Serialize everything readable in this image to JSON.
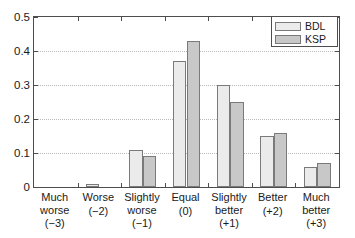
{
  "chart_data": {
    "type": "bar",
    "title": "",
    "xlabel": "",
    "ylabel": "",
    "ylim": [
      0,
      0.5
    ],
    "yticks": [
      "0",
      "0.1",
      "0.2",
      "0.3",
      "0.4",
      "0.5"
    ],
    "ytick_values": [
      0,
      0.1,
      0.2,
      0.3,
      0.4,
      0.5
    ],
    "grid": true,
    "legend_position": "top-right",
    "categories": [
      "Much worse",
      "Worse",
      "Slightly worse",
      "Equal",
      "Slightly better",
      "Better",
      "Much better"
    ],
    "category_lines": [
      {
        "line1": "Much",
        "line2": "worse",
        "value": "(−3)"
      },
      {
        "line1": "Worse",
        "line2": "",
        "value": "(−2)"
      },
      {
        "line1": "Slightly",
        "line2": "worse",
        "value": "(−1)"
      },
      {
        "line1": "Equal",
        "line2": "",
        "value": "(0)"
      },
      {
        "line1": "Slightly",
        "line2": "better",
        "value": "(+1)"
      },
      {
        "line1": "Better",
        "line2": "",
        "value": "(+2)"
      },
      {
        "line1": "Much",
        "line2": "better",
        "value": "(+3)"
      }
    ],
    "series": [
      {
        "name": "BDL",
        "color": "#ebebeb",
        "values": [
          0,
          0.01,
          0.11,
          0.37,
          0.3,
          0.15,
          0.06
        ]
      },
      {
        "name": "KSP",
        "color": "#c8c8c8",
        "values": [
          0,
          0,
          0.09,
          0.43,
          0.25,
          0.16,
          0.07
        ]
      }
    ]
  },
  "legend": {
    "entries": [
      {
        "label": "BDL"
      },
      {
        "label": "KSP"
      }
    ]
  }
}
